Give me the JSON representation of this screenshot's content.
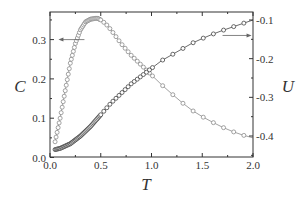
{
  "chart_data": {
    "type": "scatter",
    "title": "",
    "xlabel": "T",
    "ylabel": "C",
    "y2label": "U",
    "xlim": [
      0.0,
      2.0
    ],
    "ylim": [
      0.0,
      0.37
    ],
    "y2lim": [
      -0.45,
      -0.09
    ],
    "xticks": [
      "0.0",
      "0.5",
      "1.0",
      "1.5",
      "2.0"
    ],
    "yticks": [
      "0.0",
      "0.1",
      "0.2",
      "0.3"
    ],
    "y2ticks": [
      "-0.1",
      "-0.2",
      "-0.3",
      "-0.4"
    ],
    "grid": false,
    "legend": "none (arrows indicate axis association)",
    "annotations": [
      {
        "type": "arrow",
        "points_to": "left axis (C)",
        "at": {
          "T": 0.3,
          "C": 0.3
        }
      },
      {
        "type": "arrow",
        "points_to": "right axis (U)",
        "at": {
          "T": 1.85,
          "U": -0.14
        }
      }
    ],
    "series": [
      {
        "name": "C",
        "axis": "left",
        "color": "#8a8a8a",
        "marker": "open-circle",
        "x": [
          0.05,
          0.1,
          0.15,
          0.2,
          0.25,
          0.3,
          0.35,
          0.4,
          0.45,
          0.47,
          0.5,
          0.55,
          0.6,
          0.7,
          0.8,
          0.9,
          1.0,
          1.1,
          1.2,
          1.3,
          1.4,
          1.5,
          1.6,
          1.7,
          1.8,
          1.9,
          2.0
        ],
        "values": [
          0.04,
          0.1,
          0.17,
          0.24,
          0.29,
          0.325,
          0.345,
          0.352,
          0.354,
          0.354,
          0.35,
          0.34,
          0.325,
          0.29,
          0.26,
          0.235,
          0.21,
          0.185,
          0.162,
          0.14,
          0.12,
          0.104,
          0.09,
          0.077,
          0.066,
          0.057,
          0.05
        ]
      },
      {
        "name": "U",
        "axis": "right",
        "color": "#444444",
        "marker": "open-circle",
        "x": [
          0.05,
          0.1,
          0.2,
          0.3,
          0.4,
          0.5,
          0.6,
          0.7,
          0.8,
          0.9,
          1.0,
          1.1,
          1.2,
          1.3,
          1.4,
          1.5,
          1.6,
          1.7,
          1.8,
          1.9,
          2.0
        ],
        "values": [
          -0.435,
          -0.432,
          -0.42,
          -0.4,
          -0.375,
          -0.345,
          -0.315,
          -0.29,
          -0.265,
          -0.245,
          -0.225,
          -0.205,
          -0.19,
          -0.175,
          -0.16,
          -0.148,
          -0.137,
          -0.127,
          -0.118,
          -0.109,
          -0.1
        ]
      }
    ]
  },
  "colors": {
    "axis": "#333333",
    "c_series": "#8a8a8a",
    "u_series": "#444444"
  }
}
